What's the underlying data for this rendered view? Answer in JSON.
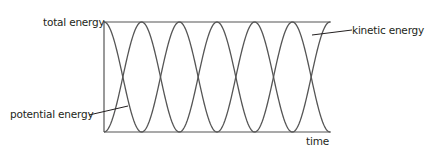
{
  "diagram": {
    "labels": {
      "total_energy": "total energy",
      "kinetic_energy": "kinetic energy",
      "potential_energy": "potential energy",
      "time": "time"
    },
    "colors": {
      "axis": "#555555",
      "curve": "#555555",
      "text": "#231f20"
    },
    "geometry": {
      "x_start": 104,
      "x_end": 330,
      "y_top": 22,
      "y_bottom": 132,
      "half_periods": 6
    }
  }
}
